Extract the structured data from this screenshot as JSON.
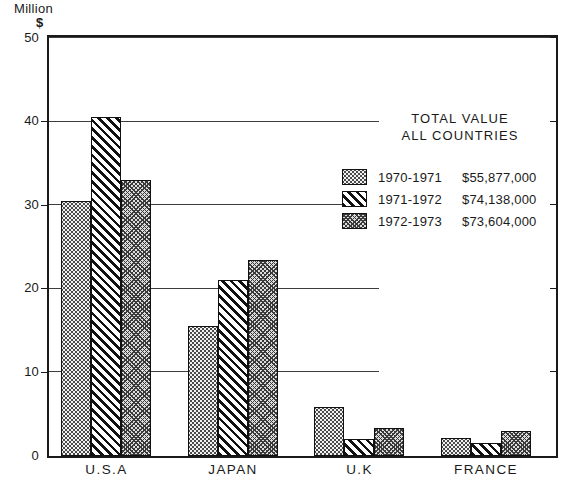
{
  "chart_data": {
    "type": "bar",
    "title": "",
    "ylabel": "Million $",
    "ylabel_line1": "Million",
    "ylabel_line2": "$",
    "xlabel": "",
    "ylim": [
      0,
      50
    ],
    "yticks": [
      0,
      10,
      20,
      30,
      40,
      50
    ],
    "ytick_labels": [
      "0",
      "10",
      "20",
      "30",
      "40",
      "50"
    ],
    "grid": true,
    "legend_position": "upper right inside",
    "categories": [
      "U.S.A",
      "JAPAN",
      "U.K",
      "FRANCE"
    ],
    "series": [
      {
        "name": "1970-1971",
        "pattern": "dotted",
        "total": "$55,877,000",
        "values": [
          30.5,
          15.6,
          5.9,
          2.2
        ]
      },
      {
        "name": "1971-1972",
        "pattern": "diagonal-hatch",
        "total": "$74,138,000",
        "values": [
          40.5,
          21.0,
          2.0,
          1.5
        ]
      },
      {
        "name": "1972-1973",
        "pattern": "crosshatch",
        "total": "$73,604,000",
        "values": [
          33.0,
          23.4,
          3.3,
          3.0
        ]
      }
    ],
    "annotations": {
      "legend_title_line1": "TOTAL VALUE",
      "legend_title_line2": "ALL COUNTRIES"
    }
  },
  "colors": {
    "axis": "#1a1a1a",
    "grid": "#3d3d3d",
    "background": "#ffffff"
  }
}
